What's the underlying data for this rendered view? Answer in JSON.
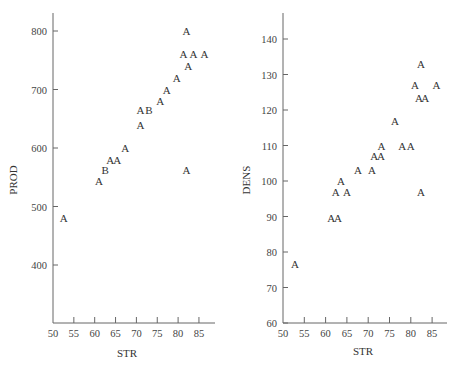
{
  "chart_data": [
    {
      "type": "scatter",
      "title": "",
      "xlabel": "STR",
      "ylabel": "PROD",
      "xlim": [
        50,
        88
      ],
      "ylim": [
        300,
        820
      ],
      "xticks": [
        50,
        55,
        60,
        65,
        70,
        75,
        80,
        85
      ],
      "yticks": [
        400,
        500,
        600,
        700,
        800
      ],
      "grid": false,
      "marker": "letter",
      "points": [
        {
          "x": 82,
          "y": 800,
          "label": "A"
        },
        {
          "x": 81.3,
          "y": 760,
          "label": "A"
        },
        {
          "x": 83.7,
          "y": 760,
          "label": "A"
        },
        {
          "x": 86.3,
          "y": 760,
          "label": "A"
        },
        {
          "x": 82.4,
          "y": 740,
          "label": "A"
        },
        {
          "x": 79.7,
          "y": 720,
          "label": "A"
        },
        {
          "x": 77.3,
          "y": 700,
          "label": "A"
        },
        {
          "x": 75.7,
          "y": 680,
          "label": "A"
        },
        {
          "x": 71,
          "y": 665,
          "label": "A"
        },
        {
          "x": 73,
          "y": 665,
          "label": "B"
        },
        {
          "x": 71,
          "y": 640,
          "label": "A"
        },
        {
          "x": 67.3,
          "y": 600,
          "label": "A"
        },
        {
          "x": 63.7,
          "y": 580,
          "label": "A"
        },
        {
          "x": 65.4,
          "y": 580,
          "label": "A"
        },
        {
          "x": 62.5,
          "y": 563,
          "label": "B"
        },
        {
          "x": 61,
          "y": 543,
          "label": "A"
        },
        {
          "x": 82,
          "y": 563,
          "label": "A"
        },
        {
          "x": 52.6,
          "y": 480,
          "label": "A"
        }
      ]
    },
    {
      "type": "scatter",
      "title": "",
      "xlabel": "STR",
      "ylabel": "DENS",
      "xlim": [
        50,
        88
      ],
      "ylim": [
        60,
        147
      ],
      "xticks": [
        50,
        55,
        60,
        65,
        70,
        75,
        80,
        85
      ],
      "yticks": [
        60,
        70,
        80,
        90,
        100,
        110,
        120,
        130,
        140
      ],
      "grid": false,
      "marker": "letter",
      "points": [
        {
          "x": 82.4,
          "y": 133,
          "label": "A"
        },
        {
          "x": 81,
          "y": 127,
          "label": "A"
        },
        {
          "x": 86,
          "y": 127,
          "label": "A"
        },
        {
          "x": 81.9,
          "y": 123.5,
          "label": "A"
        },
        {
          "x": 83.4,
          "y": 123.5,
          "label": "A"
        },
        {
          "x": 76.3,
          "y": 117,
          "label": "A"
        },
        {
          "x": 73.1,
          "y": 110,
          "label": "A"
        },
        {
          "x": 78,
          "y": 110,
          "label": "A"
        },
        {
          "x": 80,
          "y": 110,
          "label": "A"
        },
        {
          "x": 71.4,
          "y": 107,
          "label": "A"
        },
        {
          "x": 73,
          "y": 107,
          "label": "A"
        },
        {
          "x": 67.6,
          "y": 103,
          "label": "A"
        },
        {
          "x": 70.9,
          "y": 103,
          "label": "A"
        },
        {
          "x": 63.6,
          "y": 100,
          "label": "A"
        },
        {
          "x": 62.4,
          "y": 97,
          "label": "A"
        },
        {
          "x": 65,
          "y": 97,
          "label": "A"
        },
        {
          "x": 82.4,
          "y": 97,
          "label": "A"
        },
        {
          "x": 61.3,
          "y": 89.5,
          "label": "A"
        },
        {
          "x": 62.9,
          "y": 89.5,
          "label": "A"
        },
        {
          "x": 52.8,
          "y": 76.5,
          "label": "A"
        }
      ]
    }
  ],
  "panels": [
    {
      "ylabel": "PROD",
      "xlabel": "STR"
    },
    {
      "ylabel": "DENS",
      "xlabel": "STR"
    }
  ]
}
